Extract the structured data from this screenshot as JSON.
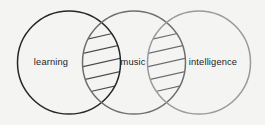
{
  "diagram": {
    "type": "venn-chain",
    "title": "",
    "background_color": "#f4f4f3",
    "sets": [
      {
        "id": "learning",
        "label": "learning",
        "stroke_color": "#262626",
        "stroke_width": 1.5,
        "cx": 69,
        "cy": 62.5,
        "r": 51.5,
        "label_x": 51,
        "label_y": 63
      },
      {
        "id": "music",
        "label": "music",
        "stroke_color": "#6e6e6e",
        "stroke_width": 1.5,
        "cx": 134,
        "cy": 62.5,
        "r": 51.5,
        "label_x": 133,
        "label_y": 63
      },
      {
        "id": "intelligence",
        "label": "intelligence",
        "stroke_color": "#9a9a9a",
        "stroke_width": 1.5,
        "cx": 199,
        "cy": 62.5,
        "r": 51.5,
        "label_x": 213,
        "label_y": 63
      }
    ],
    "intersections": [
      {
        "id": "learning-music",
        "between": [
          "learning",
          "music"
        ],
        "fill": "none",
        "hatch": {
          "line_color": "#4a4a4a",
          "line_width": 1.2,
          "line_count": 5,
          "direction": "down-left-to-up-right"
        }
      },
      {
        "id": "music-intelligence",
        "between": [
          "music",
          "intelligence"
        ],
        "fill": "none",
        "hatch": {
          "line_color": "#6a6a6a",
          "line_width": 1.2,
          "line_count": 5,
          "direction": "down-left-to-up-right"
        }
      }
    ]
  }
}
